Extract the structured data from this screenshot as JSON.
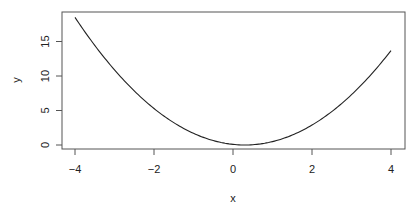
{
  "chart_data": {
    "type": "line",
    "title": "",
    "xlabel": "x",
    "ylabel": "y",
    "xlim": [
      -4.3,
      4.3
    ],
    "ylim": [
      -0.7,
      19.2
    ],
    "x_ticks": [
      -4,
      -2,
      0,
      2,
      4
    ],
    "x_tick_labels": [
      "−4",
      "−2",
      "0",
      "2",
      "4"
    ],
    "y_ticks": [
      0,
      5,
      10,
      15
    ],
    "y_tick_labels": [
      "0",
      "5",
      "10",
      "15"
    ],
    "grid": false,
    "legend": null,
    "series": [
      {
        "name": "y = (x - 0.3)^2",
        "x": [
          -4,
          -3.5,
          -3,
          -2.5,
          -2,
          -1.5,
          -1,
          -0.5,
          0,
          0.3,
          0.5,
          1,
          1.5,
          2,
          2.5,
          3,
          3.5,
          4
        ],
        "y": [
          18.49,
          14.44,
          10.89,
          7.84,
          5.29,
          3.24,
          1.69,
          0.64,
          0.09,
          0.0,
          0.04,
          0.49,
          1.44,
          2.89,
          4.84,
          7.29,
          10.24,
          13.69
        ]
      }
    ],
    "colors": {
      "line": "#222222",
      "axis": "#555555",
      "box": "#555555"
    }
  }
}
